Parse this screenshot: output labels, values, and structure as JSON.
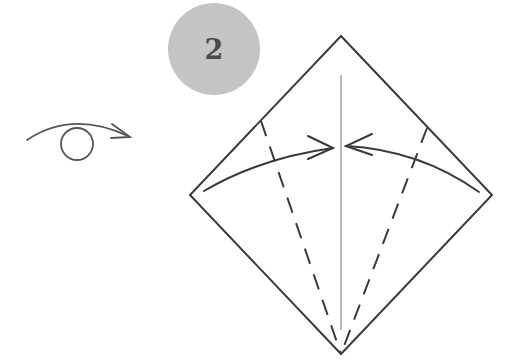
{
  "diagram": {
    "type": "origami-instruction-step",
    "step_number": "2",
    "badge_color": "#c4c4c4",
    "line_color": "#3a3a3a",
    "symbols": {
      "turn_over": "turn-over-icon",
      "fold_arrows": [
        "valley-fold-arrow-left",
        "valley-fold-arrow-right"
      ],
      "fold_lines": [
        "dashed-valley-fold-left",
        "dashed-valley-fold-right"
      ],
      "center_crease": "center-crease-line"
    },
    "paper": {
      "shape": "square-diamond",
      "vertices": {
        "top": [
          341,
          36
        ],
        "left": [
          190,
          195
        ],
        "right": [
          492,
          195
        ],
        "bottom": [
          341,
          354
        ]
      }
    }
  }
}
